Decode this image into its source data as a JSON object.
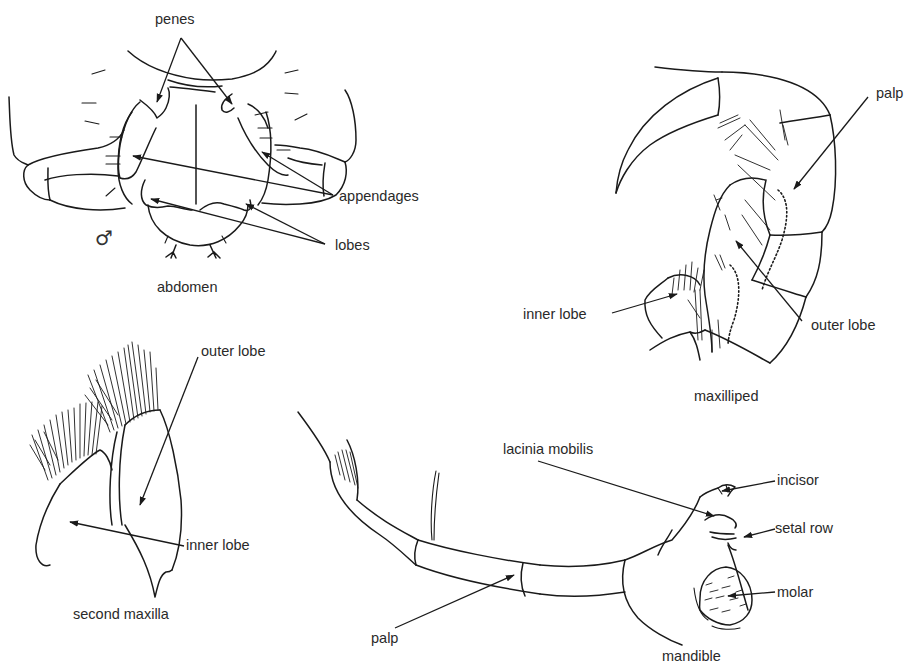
{
  "figure": {
    "panels": [
      {
        "id": "abdomen",
        "caption": "abdomen",
        "sex_symbol": "♂",
        "labels": [
          "penes",
          "appendages",
          "lobes"
        ]
      },
      {
        "id": "maxilliped",
        "caption": "maxilliped",
        "labels": [
          "palp",
          "inner lobe",
          "outer lobe"
        ]
      },
      {
        "id": "second-maxilla",
        "caption": "second maxilla",
        "labels": [
          "outer lobe",
          "inner lobe"
        ]
      },
      {
        "id": "mandible",
        "caption": "mandible",
        "labels": [
          "lacinia mobilis",
          "incisor",
          "setal row",
          "molar",
          "palp"
        ]
      }
    ]
  },
  "ink_color": "#1a1a1a",
  "background": "#ffffff"
}
